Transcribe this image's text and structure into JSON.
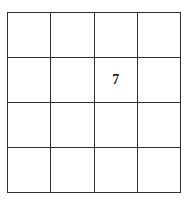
{
  "figure": {
    "kind": "grid-figure",
    "background_color": "#ffffff",
    "line_color": "#2e2e2e",
    "text_color": "#1a1a1a"
  },
  "grid": {
    "rows": 4,
    "columns": 4,
    "cells": [
      [
        "",
        "",
        "",
        ""
      ],
      [
        "",
        "",
        "7",
        ""
      ],
      [
        "",
        "",
        "",
        ""
      ],
      [
        "",
        "",
        "",
        ""
      ]
    ],
    "filled_cell": {
      "row": 2,
      "column": 3,
      "value": "7"
    }
  }
}
